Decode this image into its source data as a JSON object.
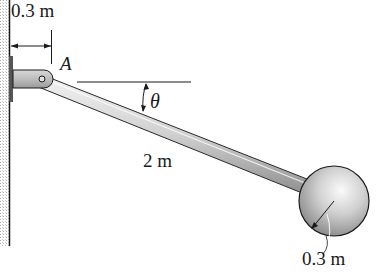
{
  "figure": {
    "dimension_top": "0.3 m",
    "point_label": "A",
    "angle_label": "θ",
    "rod_length": "2 m",
    "sphere_radius": "0.3 m"
  },
  "colors": {
    "line": "#1a1a1a",
    "rod_light": "#e6e6e6",
    "rod_dark": "#9a9a9a",
    "wall_hatch": "#b8b8b8",
    "sphere_light": "#f2f2f2",
    "sphere_dark": "#8c8c8c"
  }
}
